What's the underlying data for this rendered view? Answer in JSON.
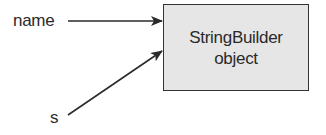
{
  "diagram": {
    "type": "reference-diagram",
    "variables": [
      {
        "id": "name",
        "label": "name"
      },
      {
        "id": "s",
        "label": "s"
      }
    ],
    "object": {
      "line1": "StringBuilder",
      "line2": "object",
      "fill": "#e6e6e6",
      "border": "#333333"
    },
    "edges": [
      {
        "from": "name",
        "to": "object"
      },
      {
        "from": "s",
        "to": "object"
      }
    ]
  }
}
